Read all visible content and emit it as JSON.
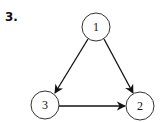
{
  "problem_label": "3.",
  "diagram": {
    "nodes": [
      {
        "id": "1",
        "label": "1",
        "cx": 96,
        "cy": 27
      },
      {
        "id": "2",
        "label": "2",
        "cx": 140,
        "cy": 106
      },
      {
        "id": "3",
        "label": "3",
        "cx": 45,
        "cy": 105
      }
    ],
    "edges": [
      {
        "from": "1",
        "to": "3"
      },
      {
        "from": "1",
        "to": "2"
      },
      {
        "from": "3",
        "to": "2"
      }
    ]
  }
}
